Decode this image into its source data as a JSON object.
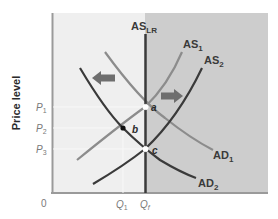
{
  "diagram": {
    "type": "AS-AD model",
    "ylabel": "Price level",
    "origin_label": "0",
    "colors": {
      "left_bg": "#efefef",
      "right_bg": "#cdcdcd",
      "axis": "#9a9a9a",
      "as_lr": "#3a3a3a",
      "dark_curve": "#3a3a3a",
      "light_curve": "#8c8c8c",
      "arrow": "#6e6e6e"
    },
    "curves": {
      "as_lr": {
        "label": "AS",
        "sub": "LR"
      },
      "as1": {
        "label": "AS",
        "sub": "1"
      },
      "as2": {
        "label": "AS",
        "sub": "2"
      },
      "ad1": {
        "label": "AD",
        "sub": "1"
      },
      "ad2": {
        "label": "AD",
        "sub": "2"
      }
    },
    "y_ticks": [
      {
        "label": "P",
        "sub": "1"
      },
      {
        "label": "P",
        "sub": "2"
      },
      {
        "label": "P",
        "sub": "3"
      }
    ],
    "x_ticks": [
      {
        "label": "Q",
        "sub": "1"
      },
      {
        "label": "Q",
        "sub": "f"
      }
    ],
    "points": [
      {
        "label": "a",
        "style": "open"
      },
      {
        "label": "b",
        "style": "filled"
      },
      {
        "label": "c",
        "style": "open"
      }
    ],
    "arrows": [
      {
        "direction": "left",
        "meaning": "aggregate demand shifts left"
      },
      {
        "direction": "right",
        "meaning": "aggregate supply shifts right"
      }
    ]
  }
}
